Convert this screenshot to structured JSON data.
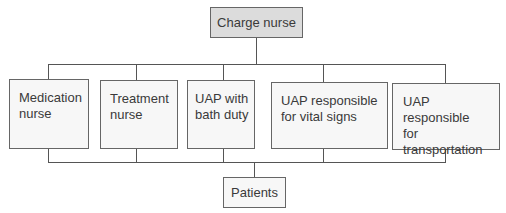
{
  "diagram": {
    "top": {
      "label": "Charge nurse"
    },
    "roles": [
      {
        "line1": "Medication",
        "line2": "nurse"
      },
      {
        "line1": "Treatment",
        "line2": "nurse"
      },
      {
        "line1": "UAP with",
        "line2": "bath duty"
      },
      {
        "line1": "UAP responsible",
        "line2": "for vital signs"
      },
      {
        "line1": "UAP responsible",
        "line2": "for transportation"
      }
    ],
    "bottom": {
      "label": "Patients"
    },
    "colors": {
      "top_box_fill": "#dcdcdc",
      "box_fill": "#f7f7f7",
      "line": "#555555"
    }
  }
}
